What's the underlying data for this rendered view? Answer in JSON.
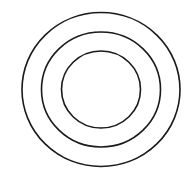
{
  "diagram": {
    "type": "concentric-circles",
    "background": "#ffffff",
    "stroke_color": "#1a1a1a",
    "stroke_width": 1.6,
    "center": {
      "cx": 101,
      "cy": 89.5
    },
    "rings": [
      {
        "name": "outer-ring",
        "rx": 79,
        "ry": 77
      },
      {
        "name": "middle-ring",
        "rx": 59.5,
        "ry": 57.5
      },
      {
        "name": "inner-ring",
        "rx": 39.5,
        "ry": 38.5
      }
    ]
  }
}
